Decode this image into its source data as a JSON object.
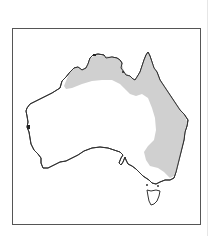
{
  "map": {
    "subject": "Australia distribution map",
    "regions": [
      {
        "name": "mainland-australia",
        "fill": "#ffffff",
        "stroke": "#333333"
      },
      {
        "name": "tasmania",
        "fill": "#ffffff",
        "stroke": "#333333"
      },
      {
        "name": "distribution-range",
        "fill": "#d0d0d0",
        "description": "Northern coastal band and eastern Queensland/NSW region"
      }
    ],
    "colors": {
      "frame_border": "#555555",
      "coastline": "#333333",
      "shaded_range": "#d0d0d0",
      "background": "#ffffff"
    }
  }
}
